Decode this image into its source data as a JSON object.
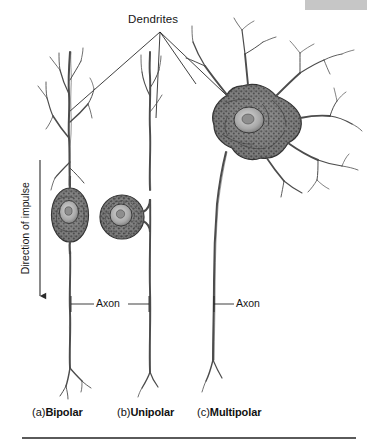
{
  "figure": {
    "title_label": "Dendrites",
    "axon_label_left": "Axon",
    "axon_label_right": "Axon",
    "direction_label": "Direction of impulse",
    "header_bar_color": "#c6c6c6",
    "ink_color": "#3a3a3a",
    "rule_color": "#5a5a5a"
  },
  "captions": [
    {
      "prefix": "(a)",
      "name": "Bipolar"
    },
    {
      "prefix": "(b)",
      "name": "Unipolar"
    },
    {
      "prefix": "(c)",
      "name": "Multipolar"
    }
  ],
  "neurons": [
    {
      "id": "bipolar",
      "name": "Bipolar",
      "soma_shape": "spindle-oval",
      "dendrite_count": 1,
      "axon_count": 1
    },
    {
      "id": "unipolar",
      "name": "Unipolar",
      "soma_shape": "round",
      "dendrite_count": 1,
      "axon_count": 1
    },
    {
      "id": "multipolar",
      "name": "Multipolar",
      "soma_shape": "stellate",
      "dendrite_count": 5,
      "axon_count": 1
    }
  ]
}
